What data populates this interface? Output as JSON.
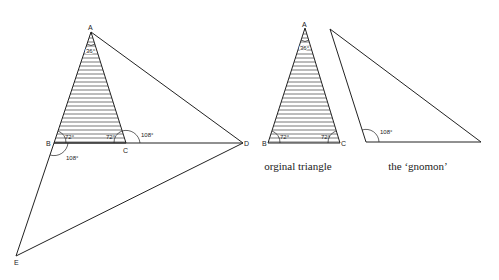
{
  "figure": {
    "left_construction": {
      "vertices": {
        "A": {
          "label": "A",
          "x": 91,
          "y": 32
        },
        "B": {
          "label": "B",
          "x": 54,
          "y": 143
        },
        "C": {
          "label": "C",
          "x": 126,
          "y": 143
        },
        "D": {
          "label": "D",
          "x": 243,
          "y": 143
        },
        "E": {
          "label": "E",
          "x": 16,
          "y": 256
        }
      },
      "angles": {
        "apex_A": "36°",
        "base_B": "72°",
        "base_C": "72°",
        "exterior_C": "108°",
        "exterior_B": "108°"
      }
    },
    "original_triangle": {
      "vertices": {
        "A": {
          "label": "A",
          "x": 305,
          "y": 28
        },
        "B": {
          "label": "B",
          "x": 268,
          "y": 143
        },
        "C": {
          "label": "C",
          "x": 340,
          "y": 143
        }
      },
      "angles": {
        "apex_A": "36°",
        "base_B": "72°",
        "base_C": "72°"
      },
      "caption": "orginal triangle"
    },
    "gnomon": {
      "vertices": {
        "top": {
          "x": 330,
          "y": 29
        },
        "bottom_left": {
          "x": 366,
          "y": 142
        },
        "bottom_right": {
          "x": 481,
          "y": 142
        }
      },
      "angles": {
        "bottom_left": "108°"
      },
      "caption": "the ‘gnomon’"
    }
  },
  "colors": {
    "stroke": "#222222",
    "hatch": "#555555",
    "background": "#ffffff"
  }
}
